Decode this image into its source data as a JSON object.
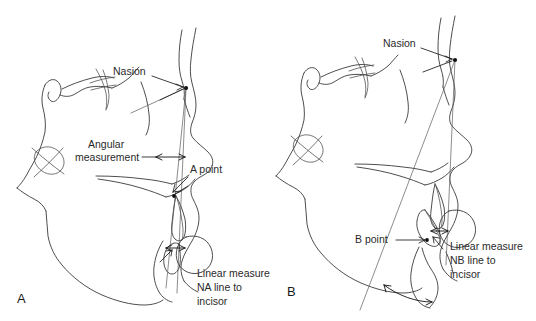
{
  "figure": {
    "background_color": "#ffffff",
    "trace_color": "#3a3a3a",
    "text_color": "#2a2a2a",
    "panels": [
      {
        "id": "A",
        "panel_label": "A",
        "description": "Lateral cephalometric tracing showing Nasion, A point, the NA line, the angular measurement SNA region and the linear measure from NA line to maxillary incisor",
        "labels": [
          {
            "name": "nasion",
            "text": "Nasion"
          },
          {
            "name": "angular-measurement-line1",
            "text": "Angular"
          },
          {
            "name": "angular-measurement-line2",
            "text": "measurement"
          },
          {
            "name": "a-point",
            "text": "A point"
          },
          {
            "name": "linear-measure-line1",
            "text": "Linear measure"
          },
          {
            "name": "linear-measure-line2",
            "text": "NA line to"
          },
          {
            "name": "linear-measure-line3",
            "text": "incisor"
          }
        ]
      },
      {
        "id": "B",
        "panel_label": "B",
        "description": "Lateral cephalometric tracing showing Nasion, B point, the NB line and the linear measure from NB line to mandibular incisor",
        "labels": [
          {
            "name": "nasion",
            "text": "Nasion"
          },
          {
            "name": "b-point",
            "text": "B point"
          },
          {
            "name": "linear-measure-line1",
            "text": "Linear measure"
          },
          {
            "name": "linear-measure-line2",
            "text": "NB line to"
          },
          {
            "name": "linear-measure-line3",
            "text": "incisor"
          }
        ]
      }
    ]
  }
}
